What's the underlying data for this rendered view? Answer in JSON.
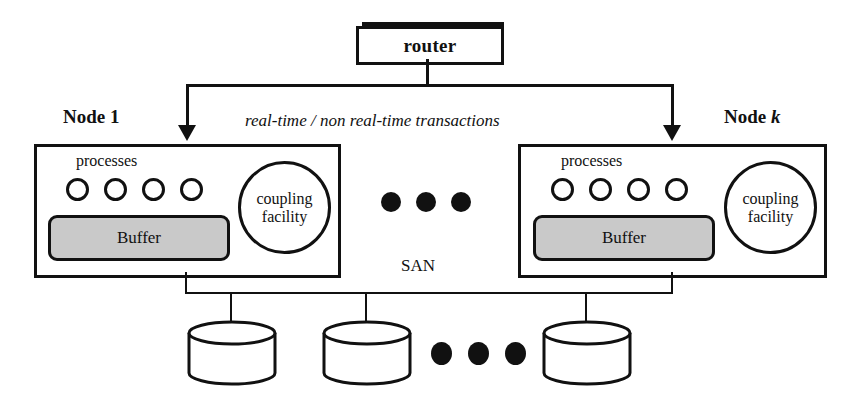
{
  "diagram": {
    "router": {
      "label": "router"
    },
    "flow_label": "real-time / non real-time transactions",
    "san_label": "SAN",
    "nodes": [
      {
        "title_prefix": "Node ",
        "title_suffix": "1",
        "processes_label": "processes",
        "process_count": 4,
        "buffer_label": "Buffer",
        "coupling_line1": "coupling",
        "coupling_line2": "facility"
      },
      {
        "title_prefix": "Node ",
        "title_suffix": "k",
        "processes_label": "processes",
        "process_count": 4,
        "buffer_label": "Buffer",
        "coupling_line1": "coupling",
        "coupling_line2": "facility"
      }
    ],
    "ellipsis_between_nodes": "• • •",
    "ellipsis_between_disks": "• • •",
    "disk_count": 3,
    "colors": {
      "stroke": "#111111",
      "background": "#ffffff",
      "buffer_fill": "#c9c9c9"
    }
  }
}
